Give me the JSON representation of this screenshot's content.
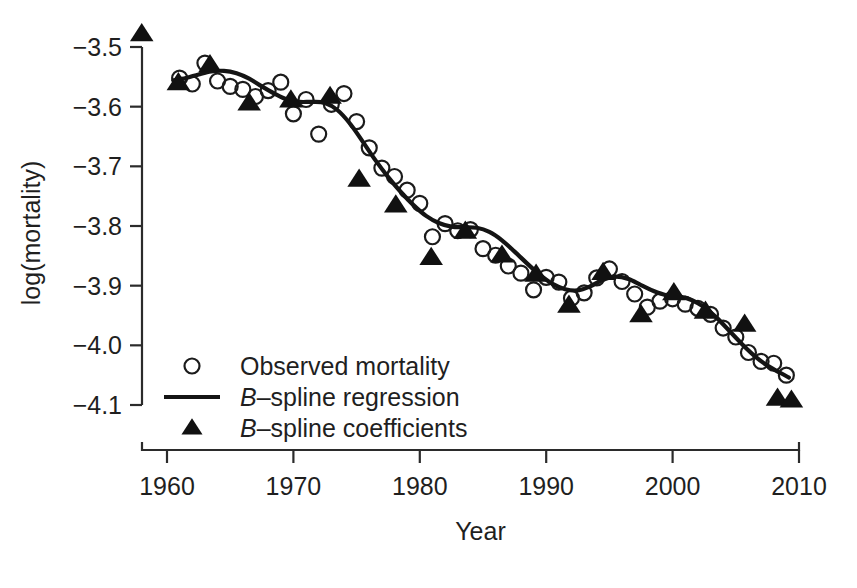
{
  "chart_data": {
    "type": "scatter",
    "title": "",
    "xlabel": "Year",
    "ylabel": "log(mortality)",
    "xlim": [
      1958,
      2010
    ],
    "ylim": [
      -4.16,
      -3.46
    ],
    "xticks": [
      1960,
      1970,
      1980,
      1990,
      2000,
      2010
    ],
    "xtick_labels": [
      "1960",
      "1970",
      "1980",
      "1990",
      "2000",
      "2010"
    ],
    "yticks": [
      -3.5,
      -3.6,
      -3.7,
      -3.8,
      -3.9,
      -4.0,
      -4.1
    ],
    "ytick_labels": [
      "−3.5",
      "−3.6",
      "−3.7",
      "−3.8",
      "−3.9",
      "−4.0",
      "−4.1"
    ],
    "grid": false,
    "legend_position": "lower-left-inside",
    "series": [
      {
        "name": "Observed mortality",
        "marker": "open-circle",
        "x": [
          1961,
          1962,
          1963,
          1964,
          1965,
          1966,
          1967,
          1968,
          1969,
          1970,
          1971,
          1972,
          1973,
          1974,
          1975,
          1976,
          1977,
          1978,
          1979,
          1980,
          1981,
          1982,
          1983,
          1984,
          1985,
          1986,
          1987,
          1988,
          1989,
          1990,
          1991,
          1992,
          1993,
          1994,
          1995,
          1996,
          1997,
          1998,
          1999,
          2000,
          2001,
          2002,
          2003,
          2004,
          2005,
          2006,
          2007,
          2008,
          2009
        ],
        "y": [
          -3.552,
          -3.562,
          -3.527,
          -3.557,
          -3.566,
          -3.571,
          -3.583,
          -3.573,
          -3.559,
          -3.612,
          -3.588,
          -3.646,
          -3.596,
          -3.578,
          -3.625,
          -3.669,
          -3.703,
          -3.717,
          -3.74,
          -3.762,
          -3.818,
          -3.796,
          -3.808,
          -3.806,
          -3.838,
          -3.849,
          -3.867,
          -3.879,
          -3.907,
          -3.886,
          -3.894,
          -3.921,
          -3.912,
          -3.887,
          -3.872,
          -3.893,
          -3.914,
          -3.936,
          -3.926,
          -3.922,
          -3.931,
          -3.938,
          -3.948,
          -3.971,
          -3.986,
          -4.012,
          -4.027,
          -4.03,
          -4.05
        ]
      },
      {
        "name": "B-spline regression",
        "marker": "line",
        "x": [
          1960.5,
          1961.5,
          1962.5,
          1963.5,
          1964.5,
          1965.5,
          1966.5,
          1967.5,
          1968.5,
          1969.5,
          1970.5,
          1971.5,
          1972.5,
          1973.5,
          1974.5,
          1975.5,
          1976.5,
          1977.5,
          1978.5,
          1979.5,
          1980.5,
          1981.5,
          1982.5,
          1983.5,
          1984.5,
          1985.5,
          1986.5,
          1987.5,
          1988.5,
          1989.5,
          1990.5,
          1991.5,
          1992.5,
          1993.5,
          1994.5,
          1995.5,
          1996.5,
          1997.5,
          1998.5,
          1999.5,
          2000.5,
          2001.5,
          2002.5,
          2003.5,
          2004.5,
          2005.5,
          2006.5,
          2007.5,
          2008.5,
          2009.2
        ],
        "y": [
          -3.556,
          -3.552,
          -3.546,
          -3.541,
          -3.54,
          -3.544,
          -3.553,
          -3.566,
          -3.578,
          -3.588,
          -3.592,
          -3.592,
          -3.594,
          -3.606,
          -3.629,
          -3.659,
          -3.69,
          -3.718,
          -3.743,
          -3.765,
          -3.783,
          -3.795,
          -3.801,
          -3.802,
          -3.803,
          -3.81,
          -3.824,
          -3.843,
          -3.863,
          -3.882,
          -3.897,
          -3.906,
          -3.908,
          -3.901,
          -3.89,
          -3.885,
          -3.889,
          -3.899,
          -3.909,
          -3.916,
          -3.918,
          -3.924,
          -3.936,
          -3.954,
          -3.976,
          -3.998,
          -4.018,
          -4.034,
          -4.046,
          -4.054
        ]
      },
      {
        "name": "B-spline coefficients",
        "marker": "filled-triangle",
        "x": [
          1958.0,
          1960.9,
          1963.4,
          1966.5,
          1969.8,
          1972.9,
          1975.2,
          1978.1,
          1980.9,
          1983.6,
          1986.5,
          1989.2,
          1991.8,
          1994.5,
          1997.5,
          2000.1,
          2002.6,
          2005.7,
          2008.3,
          2009.4
        ],
        "y": [
          -3.478,
          -3.56,
          -3.53,
          -3.594,
          -3.589,
          -3.583,
          -3.722,
          -3.765,
          -3.853,
          -3.809,
          -3.849,
          -3.881,
          -3.933,
          -3.878,
          -3.949,
          -3.912,
          -3.943,
          -3.965,
          -4.089,
          -4.092
        ]
      }
    ],
    "legend": [
      {
        "label": "Observed mortality",
        "marker": "open-circle",
        "italic_prefix": ""
      },
      {
        "label": "spline regression",
        "marker": "line",
        "italic_prefix": "B"
      },
      {
        "label": "spline coefficients",
        "marker": "filled-triangle",
        "italic_prefix": "B"
      }
    ]
  }
}
